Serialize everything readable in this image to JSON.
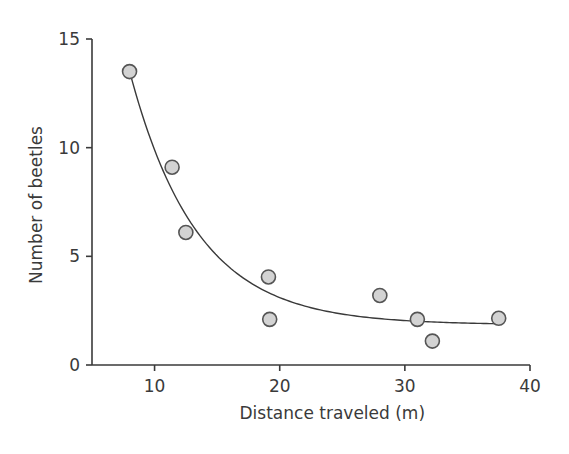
{
  "chart_data": {
    "type": "scatter",
    "title": "",
    "xlabel": "Distance traveled (m)",
    "ylabel": "Number of beetles",
    "xlim": [
      5,
      40
    ],
    "ylim": [
      0,
      15
    ],
    "x_ticks": [
      10,
      20,
      30,
      40
    ],
    "y_ticks": [
      0,
      5,
      10,
      15
    ],
    "grid": false,
    "legend": null,
    "series": [
      {
        "name": "observations",
        "points": [
          {
            "x": 8.0,
            "y": 13.5
          },
          {
            "x": 11.4,
            "y": 9.1
          },
          {
            "x": 12.5,
            "y": 6.1
          },
          {
            "x": 19.1,
            "y": 4.05
          },
          {
            "x": 19.2,
            "y": 2.1
          },
          {
            "x": 28.0,
            "y": 3.2
          },
          {
            "x": 31.0,
            "y": 2.1
          },
          {
            "x": 32.2,
            "y": 1.1
          },
          {
            "x": 37.5,
            "y": 2.15
          }
        ]
      }
    ],
    "fit_curve": {
      "type": "exponential_decay",
      "formula": "y = a*exp(-b*x) + c",
      "a": 51.7,
      "b": 0.186,
      "c": 1.85,
      "x_range": [
        8.0,
        37.5
      ]
    }
  },
  "colors": {
    "axis": "#3a3a3a",
    "point_fill": "#d3d3d3",
    "point_stroke": "#555555",
    "curve": "#3a3a3a"
  }
}
